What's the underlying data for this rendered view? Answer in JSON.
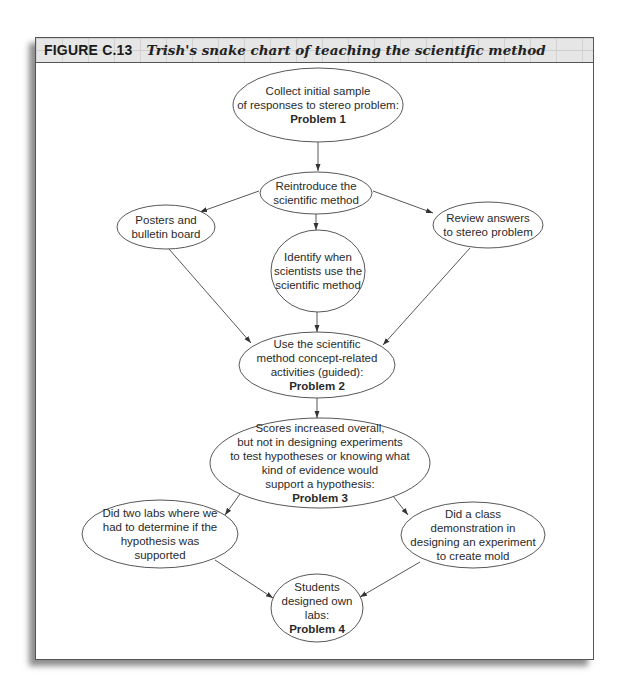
{
  "figure": {
    "label": "FIGURE C.13",
    "title": "Trish's snake chart of teaching the scientific method"
  },
  "colors": {
    "stroke": "#444444",
    "frame_border": "#555555",
    "header_bg": "#e6e6e6"
  },
  "nodes": [
    {
      "id": "n1",
      "lines": [
        "Collect initial sample",
        "of responses to stereo problem:"
      ],
      "bold": "Problem 1",
      "cx": 318,
      "cy": 105,
      "rx": 85,
      "ry": 37
    },
    {
      "id": "n2",
      "lines": [
        "Reintroduce the",
        "scientific method"
      ],
      "bold": "",
      "cx": 316,
      "cy": 193,
      "rx": 56,
      "ry": 21
    },
    {
      "id": "n3",
      "lines": [
        "Posters and",
        "bulletin board"
      ],
      "bold": "",
      "cx": 166,
      "cy": 227,
      "rx": 49,
      "ry": 22
    },
    {
      "id": "n4",
      "lines": [
        "Review answers",
        "to stereo problem"
      ],
      "bold": "",
      "cx": 488,
      "cy": 225,
      "rx": 55,
      "ry": 23
    },
    {
      "id": "n5",
      "lines": [
        "Identify when",
        "scientists use the",
        "scientific method"
      ],
      "bold": "",
      "cx": 318,
      "cy": 271,
      "rx": 47,
      "ry": 41
    },
    {
      "id": "n6",
      "lines": [
        "Use the scientific",
        "method concept-related",
        "activities (guided):"
      ],
      "bold": "Problem 2",
      "cx": 317,
      "cy": 365,
      "rx": 78,
      "ry": 33
    },
    {
      "id": "n7",
      "lines": [
        "Scores increased overall,",
        "but not in designing experiments",
        "to test hypotheses or knowing what",
        "kind of evidence would",
        "support a hypothesis:"
      ],
      "bold": "Problem 3",
      "cx": 320,
      "cy": 463,
      "rx": 110,
      "ry": 45
    },
    {
      "id": "n8",
      "lines": [
        "Did two labs where we",
        "had to determine if the",
        "hypothesis was",
        "supported"
      ],
      "bold": "",
      "cx": 160,
      "cy": 534,
      "rx": 78,
      "ry": 34
    },
    {
      "id": "n9",
      "lines": [
        "Did a class",
        "demonstration in",
        "designing an experiment",
        "to create mold"
      ],
      "bold": "",
      "cx": 473,
      "cy": 535,
      "rx": 72,
      "ry": 33
    },
    {
      "id": "n10",
      "lines": [
        "Students",
        "designed own",
        "labs:"
      ],
      "bold": "Problem 4",
      "cx": 317,
      "cy": 608,
      "rx": 46,
      "ry": 34
    }
  ],
  "edges": [
    {
      "from": "n1",
      "to": "n2",
      "x1": 318,
      "y1": 142,
      "x2": 318,
      "y2": 171
    },
    {
      "from": "n2",
      "to": "n3",
      "x1": 259,
      "y1": 191,
      "x2": 200,
      "y2": 212
    },
    {
      "from": "n2",
      "to": "n4",
      "x1": 373,
      "y1": 191,
      "x2": 433,
      "y2": 213
    },
    {
      "from": "n2",
      "to": "n5",
      "x1": 316,
      "y1": 214,
      "x2": 316,
      "y2": 230
    },
    {
      "from": "n3",
      "to": "n6",
      "x1": 169,
      "y1": 249,
      "x2": 251,
      "y2": 343
    },
    {
      "from": "n4",
      "to": "n6",
      "x1": 470,
      "y1": 248,
      "x2": 383,
      "y2": 345
    },
    {
      "from": "n5",
      "to": "n6",
      "x1": 317,
      "y1": 312,
      "x2": 317,
      "y2": 332
    },
    {
      "from": "n6",
      "to": "n7",
      "x1": 317,
      "y1": 398,
      "x2": 317,
      "y2": 418
    },
    {
      "from": "n7",
      "to": "n8",
      "x1": 240,
      "y1": 494,
      "x2": 225,
      "y2": 515
    },
    {
      "from": "n7",
      "to": "n9",
      "x1": 393,
      "y1": 496,
      "x2": 408,
      "y2": 515
    },
    {
      "from": "n8",
      "to": "n10",
      "x1": 215,
      "y1": 560,
      "x2": 273,
      "y2": 598
    },
    {
      "from": "n9",
      "to": "n10",
      "x1": 420,
      "y1": 562,
      "x2": 360,
      "y2": 597
    }
  ]
}
